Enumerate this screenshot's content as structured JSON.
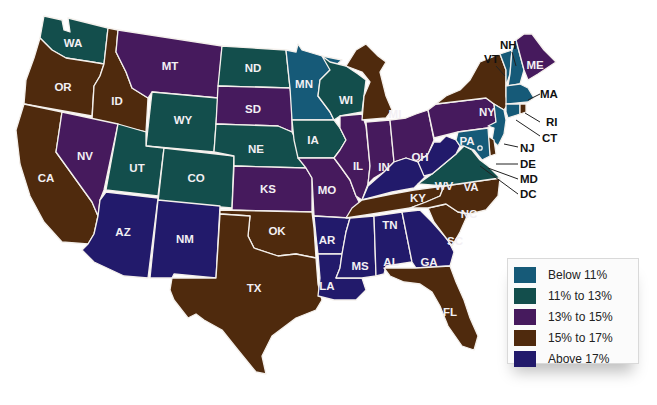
{
  "colors": {
    "below_11": "#165a78",
    "11_to_13": "#134e4c",
    "13_to_15": "#461a5d",
    "15_to_17": "#4f2a0d",
    "above_17": "#221a6b"
  },
  "legend": {
    "items": [
      {
        "key": "below_11",
        "label": "Below 11%",
        "color": "#165a78"
      },
      {
        "key": "11_to_13",
        "label": "11% to 13%",
        "color": "#134e4c"
      },
      {
        "key": "13_to_15",
        "label": "13% to 15%",
        "color": "#461a5d"
      },
      {
        "key": "15_to_17",
        "label": "15% to 17%",
        "color": "#4f2a0d"
      },
      {
        "key": "above_17",
        "label": "Above 17%",
        "color": "#221a6b"
      }
    ]
  },
  "states": {
    "WA": {
      "label": "WA",
      "category": "11_to_13"
    },
    "OR": {
      "label": "OR",
      "category": "15_to_17"
    },
    "CA": {
      "label": "CA",
      "category": "15_to_17"
    },
    "ID": {
      "label": "ID",
      "category": "15_to_17"
    },
    "NV": {
      "label": "NV",
      "category": "13_to_15"
    },
    "MT": {
      "label": "MT",
      "category": "13_to_15"
    },
    "WY": {
      "label": "WY",
      "category": "11_to_13"
    },
    "UT": {
      "label": "UT",
      "category": "11_to_13"
    },
    "CO": {
      "label": "CO",
      "category": "11_to_13"
    },
    "AZ": {
      "label": "AZ",
      "category": "above_17"
    },
    "NM": {
      "label": "NM",
      "category": "above_17"
    },
    "ND": {
      "label": "ND",
      "category": "11_to_13"
    },
    "SD": {
      "label": "SD",
      "category": "13_to_15"
    },
    "NE": {
      "label": "NE",
      "category": "11_to_13"
    },
    "KS": {
      "label": "KS",
      "category": "13_to_15"
    },
    "OK": {
      "label": "OK",
      "category": "15_to_17"
    },
    "TX": {
      "label": "TX",
      "category": "15_to_17"
    },
    "MN": {
      "label": "MN",
      "category": "below_11"
    },
    "IA": {
      "label": "IA",
      "category": "11_to_13"
    },
    "MO": {
      "label": "MO",
      "category": "13_to_15"
    },
    "AR": {
      "label": "AR",
      "category": "above_17"
    },
    "LA": {
      "label": "LA",
      "category": "above_17"
    },
    "WI": {
      "label": "WI",
      "category": "11_to_13"
    },
    "IL": {
      "label": "IL",
      "category": "13_to_15"
    },
    "MI": {
      "label": "MI",
      "category": "15_to_17"
    },
    "IN": {
      "label": "IN",
      "category": "13_to_15"
    },
    "OH": {
      "label": "OH",
      "category": "13_to_15"
    },
    "KY": {
      "label": "KY",
      "category": "above_17"
    },
    "TN": {
      "label": "TN",
      "category": "15_to_17"
    },
    "MS": {
      "label": "MS",
      "category": "above_17"
    },
    "AL": {
      "label": "AL",
      "category": "above_17"
    },
    "GA": {
      "label": "GA",
      "category": "above_17"
    },
    "FL": {
      "label": "FL",
      "category": "15_to_17"
    },
    "SC": {
      "label": "SC",
      "category": "15_to_17"
    },
    "NC": {
      "label": "NC",
      "category": "15_to_17"
    },
    "VA": {
      "label": "VA",
      "category": "11_to_13"
    },
    "WV": {
      "label": "WV",
      "category": "above_17"
    },
    "PA": {
      "label": "PA",
      "category": "13_to_15"
    },
    "NY": {
      "label": "NY",
      "category": "15_to_17"
    },
    "VT": {
      "label": "VT",
      "category": "below_11"
    },
    "NH": {
      "label": "NH",
      "category": "below_11"
    },
    "ME": {
      "label": "ME",
      "category": "13_to_15"
    },
    "MA": {
      "label": "MA",
      "category": "below_11"
    },
    "RI": {
      "label": "RI",
      "category": "15_to_17"
    },
    "CT": {
      "label": "CT",
      "category": "below_11"
    },
    "NJ": {
      "label": "NJ",
      "category": "below_11"
    },
    "DE": {
      "label": "DE",
      "category": "15_to_17"
    },
    "MD": {
      "label": "MD",
      "category": "below_11"
    },
    "DC": {
      "label": "DC",
      "category": "below_11"
    }
  }
}
